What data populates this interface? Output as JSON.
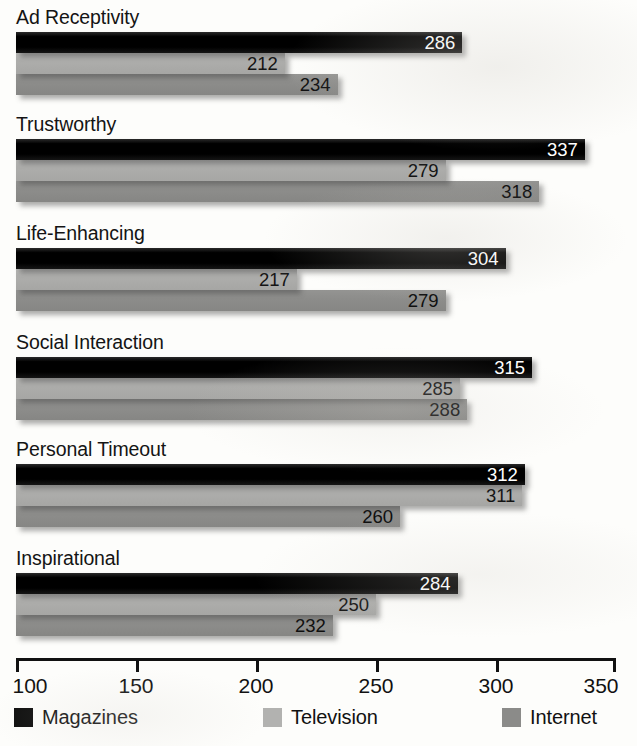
{
  "chart_data": {
    "type": "bar",
    "orientation": "horizontal",
    "title": "",
    "xlabel": "",
    "ylabel": "",
    "xlim": [
      100,
      350
    ],
    "xticks": [
      100,
      150,
      200,
      250,
      300,
      350
    ],
    "xtick_labels": [
      "100",
      "150",
      "200",
      "250",
      "300",
      "350"
    ],
    "grid": false,
    "legend_position": "bottom",
    "categories": [
      "Ad Receptivity",
      "Trustworthy",
      "Life-Enhancing",
      "Social Interaction",
      "Personal Timeout",
      "Inspirational"
    ],
    "series": [
      {
        "name": "Magazines",
        "color": "#0c0c0c",
        "values": [
          286,
          337,
          304,
          315,
          312,
          284
        ]
      },
      {
        "name": "Television",
        "color": "#b2b2b0",
        "values": [
          212,
          279,
          217,
          285,
          311,
          250
        ]
      },
      {
        "name": "Internet",
        "color": "#8b8b89",
        "values": [
          234,
          318,
          279,
          288,
          260,
          232
        ]
      }
    ]
  },
  "legend": {
    "items": [
      {
        "label": "Magazines",
        "swatch": "magazines-swatch"
      },
      {
        "label": "Television",
        "swatch": "television-swatch"
      },
      {
        "label": "Internet",
        "swatch": "internet-swatch"
      }
    ]
  }
}
